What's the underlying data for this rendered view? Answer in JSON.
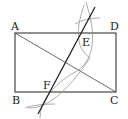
{
  "diagram": {
    "type": "geometry",
    "points": {
      "A": {
        "label": "A"
      },
      "B": {
        "label": "B"
      },
      "C": {
        "label": "C"
      },
      "D": {
        "label": "D"
      },
      "E": {
        "label": "E"
      },
      "F": {
        "label": "F"
      }
    },
    "colors": {
      "stroke": "#222222",
      "arc": "#777777",
      "background": "#ffffff"
    }
  }
}
